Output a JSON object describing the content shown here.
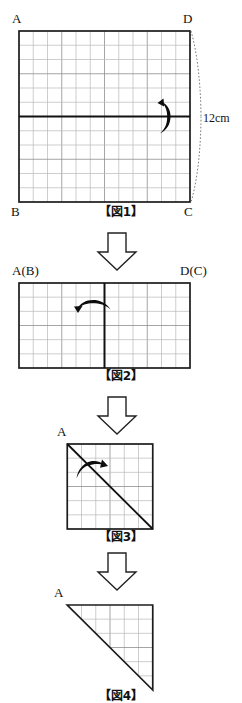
{
  "document": {
    "kind": "geometry-worksheet-figure",
    "language": "ja",
    "background_color": "#ffffff",
    "ink_color": "#111111",
    "grid_color": "#b9b9b9"
  },
  "figures": [
    {
      "id": "fig1",
      "caption": "【図1】",
      "shape": "rectangle",
      "grid_cols": 12,
      "grid_rows": 12,
      "corner_labels": {
        "top_left": "A",
        "top_right": "D",
        "bottom_left": "B",
        "bottom_right": "C"
      },
      "dimension_label": "12cm",
      "fold_line": "horizontal-center",
      "fold_arrow": "curved-fold-arrow-right"
    },
    {
      "id": "fig2",
      "caption": "【図2】",
      "shape": "rectangle",
      "grid_cols": 12,
      "grid_rows": 6,
      "corner_labels": {
        "top_left": "A(B)",
        "top_right": "D(C)"
      },
      "fold_line": "vertical-center",
      "fold_arrow": "curved-fold-arrow-left"
    },
    {
      "id": "fig3",
      "caption": "【図3】",
      "shape": "square",
      "grid_cols": 6,
      "grid_rows": 6,
      "corner_labels": {
        "top_left": "A"
      },
      "fold_line": "diagonal-top-left-to-bottom-right",
      "fold_arrow": "curved-fold-arrow-up-left"
    },
    {
      "id": "fig4",
      "caption": "【図4】",
      "shape": "right-triangle",
      "grid_cols": 6,
      "grid_rows": 6,
      "corner_labels": {
        "top_left": "A"
      },
      "hypotenuse": "top-left-to-bottom-right",
      "right_angle_corner": "top-right"
    }
  ],
  "flow_arrows": [
    {
      "id": "arrow1",
      "direction": "down",
      "between": "fig1-to-fig2"
    },
    {
      "id": "arrow2",
      "direction": "down",
      "between": "fig2-to-fig3"
    },
    {
      "id": "arrow3",
      "direction": "down",
      "between": "fig3-to-fig4"
    }
  ]
}
